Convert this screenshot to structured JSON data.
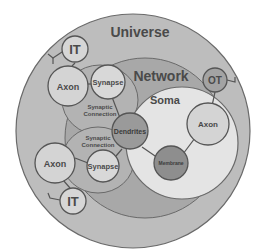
{
  "diagram": {
    "regions": {
      "universe": {
        "label": "Universe",
        "fill": "#bdbdbd"
      },
      "network": {
        "label": "Network",
        "fill": "#a8a8a8"
      },
      "soma": {
        "label": "Soma",
        "fill": "#e4e4e4"
      },
      "synaptic_upper": {
        "label_line1": "Synaptic",
        "label_line2": "Connection",
        "fill": "#b3b3b3"
      },
      "synaptic_lower": {
        "label_line1": "Synaptic",
        "label_line2": "Connection",
        "fill": "#b3b3b3"
      }
    },
    "nodes": {
      "it_top": {
        "label": "IT",
        "fill": "#d6d6d6"
      },
      "axon_top_left": {
        "label": "Axon",
        "fill": "#d4d4d4"
      },
      "synapse_upper": {
        "label": "Synapse",
        "fill": "#d8d8d8"
      },
      "ot": {
        "label": "OT",
        "fill": "#a3a3a3"
      },
      "axon_right": {
        "label": "Axon",
        "fill": "#d4d4d4"
      },
      "dendrites": {
        "label": "Dendrites",
        "fill": "#9a9a9a"
      },
      "membrane": {
        "label": "Membrane",
        "fill": "#8e8e8e"
      },
      "axon_lower_left": {
        "label": "Axon",
        "fill": "#d4d4d4"
      },
      "synapse_lower": {
        "label": "Synapse",
        "fill": "#d8d8d8"
      },
      "it_bottom": {
        "label": "IT",
        "fill": "#d6d6d6"
      }
    },
    "stroke_color": "#555555",
    "text_color": "#4a4a4a"
  }
}
